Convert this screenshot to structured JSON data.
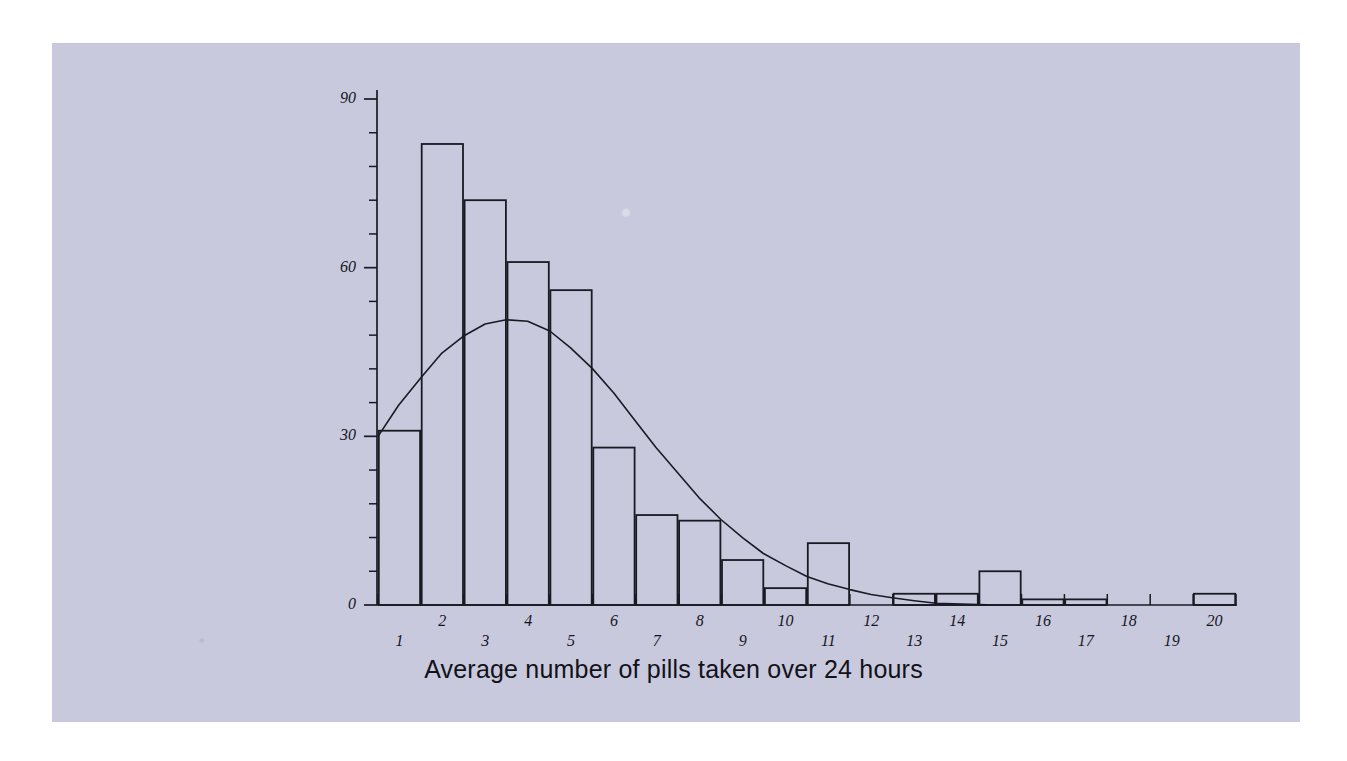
{
  "figure": {
    "background_color": "#ffffff",
    "panel_color": "#c8c9dd",
    "ink_color": "#1a1a24"
  },
  "axis_title_x": "Average number of pills taken over 24 hours",
  "y_axis": {
    "major_ticks": [
      "0",
      "30",
      "60",
      "90"
    ],
    "major_values": [
      0,
      30,
      60,
      90
    ],
    "minor_step": 6,
    "min": 0,
    "max": 93
  },
  "x_axis": {
    "tick_labels": [
      "1",
      "2",
      "3",
      "4",
      "5",
      "6",
      "7",
      "8",
      "9",
      "10",
      "11",
      "12",
      "13",
      "14",
      "15",
      "16",
      "17",
      "18",
      "19",
      "20"
    ]
  },
  "chart_data": {
    "type": "bar",
    "title": "",
    "subtitle": "",
    "xlabel": "Average number of pills taken over 24 hours",
    "ylabel": "",
    "grid": false,
    "legend": false,
    "xlim": [
      0.5,
      20.5
    ],
    "ylim": [
      0,
      93
    ],
    "categories": [
      "1",
      "2",
      "3",
      "4",
      "5",
      "6",
      "7",
      "8",
      "9",
      "10",
      "11",
      "12",
      "13",
      "14",
      "15",
      "16",
      "17",
      "18",
      "19",
      "20"
    ],
    "values": [
      31,
      82,
      72,
      61,
      56,
      28,
      16,
      15,
      8,
      3,
      11,
      0,
      2,
      2,
      6,
      1,
      1,
      0,
      0,
      2
    ],
    "series": [
      {
        "name": "Frequency",
        "type": "bar",
        "values": [
          31,
          82,
          72,
          61,
          56,
          28,
          16,
          15,
          8,
          3,
          11,
          0,
          2,
          2,
          6,
          1,
          1,
          0,
          0,
          2
        ]
      },
      {
        "name": "Normal curve overlay",
        "type": "line",
        "x": [
          1.0,
          1.5,
          2.0,
          2.5,
          3.0,
          3.5,
          4.0,
          4.5,
          5.0,
          5.5,
          6.0,
          6.5,
          7.0,
          7.5,
          8.0,
          8.5,
          9.0,
          9.5,
          10.0,
          10.5,
          11.0,
          11.5,
          12.0,
          12.5,
          13.0,
          13.5,
          14.0
        ],
        "values": [
          30.0,
          35.5,
          40.5,
          44.8,
          47.8,
          49.9,
          50.8,
          50.4,
          48.6,
          45.8,
          42.0,
          37.6,
          32.8,
          28.0,
          23.3,
          19.0,
          15.2,
          11.9,
          9.1,
          6.9,
          5.1,
          3.7,
          2.6,
          1.8,
          1.2,
          0.7,
          0.3
        ]
      }
    ]
  }
}
